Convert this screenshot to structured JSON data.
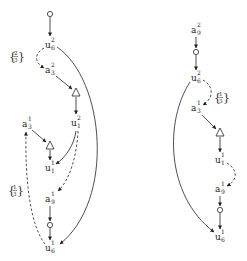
{
  "diagram": {
    "left_graph": {
      "nodes": [
        {
          "id": "start",
          "shape": "circle",
          "x": 50,
          "y": 14
        },
        {
          "id": "u6_2",
          "base": "u",
          "sub": "6",
          "sup": "2",
          "x": 50,
          "y": 45
        },
        {
          "id": "a3_2",
          "base": "a",
          "sub": "3",
          "sup": "2",
          "x": 50,
          "y": 70
        },
        {
          "id": "tri1",
          "shape": "triangle",
          "x": 76,
          "y": 93
        },
        {
          "id": "u1_2",
          "base": "u",
          "sub": "1",
          "sup": "2",
          "x": 76,
          "y": 123
        },
        {
          "id": "a3_1",
          "base": "a",
          "sub": "3",
          "sup": "1",
          "x": 27,
          "y": 124
        },
        {
          "id": "tri2",
          "shape": "triangle",
          "x": 50,
          "y": 146
        },
        {
          "id": "u1_1",
          "base": "u",
          "sub": "1",
          "sup": "1",
          "x": 50,
          "y": 168
        },
        {
          "id": "a9_1",
          "base": "a",
          "sub": "9",
          "sup": "1",
          "x": 50,
          "y": 199
        },
        {
          "id": "circ1",
          "shape": "circle",
          "x": 50,
          "y": 226
        },
        {
          "id": "u6_1",
          "base": "u",
          "sub": "6",
          "sup": "1",
          "x": 50,
          "y": 248
        }
      ],
      "labels": [
        {
          "text_num": "2",
          "text_den": "3",
          "x": 16,
          "y": 56
        },
        {
          "text_num": "1",
          "text_den": "3",
          "x": 15,
          "y": 190
        }
      ]
    },
    "right_graph": {
      "nodes": [
        {
          "id": "a9_2",
          "base": "a",
          "sub": "9",
          "sup": "2",
          "x": 196,
          "y": 30
        },
        {
          "id": "circ_r1",
          "shape": "circle",
          "x": 196,
          "y": 52
        },
        {
          "id": "u6_2r",
          "base": "u",
          "sub": "6",
          "sup": "2",
          "x": 196,
          "y": 78
        },
        {
          "id": "a3_1r",
          "base": "a",
          "sub": "3",
          "sup": "1",
          "x": 196,
          "y": 108
        },
        {
          "id": "tri_r",
          "shape": "triangle",
          "x": 220,
          "y": 133
        },
        {
          "id": "u1_1r",
          "base": "u",
          "sub": "1",
          "sup": "1",
          "x": 220,
          "y": 160
        },
        {
          "id": "a9_1r",
          "base": "a",
          "sub": "9",
          "sup": "1",
          "x": 220,
          "y": 189
        },
        {
          "id": "circ_r2",
          "shape": "circle",
          "x": 220,
          "y": 210
        },
        {
          "id": "u6_1r",
          "base": "u",
          "sub": "6",
          "sup": "1",
          "x": 220,
          "y": 237
        }
      ],
      "labels": [
        {
          "text_num": "1",
          "text_den": "3",
          "x": 222,
          "y": 97
        }
      ]
    },
    "text": {
      "u": "u",
      "a": "a",
      "s1": "1",
      "s2": "2",
      "s3": "3",
      "s6": "6",
      "s9": "9",
      "lbrace": "{",
      "rbrace": "}"
    },
    "colors": {
      "stroke": "#222222",
      "background": "#ffffff"
    }
  }
}
